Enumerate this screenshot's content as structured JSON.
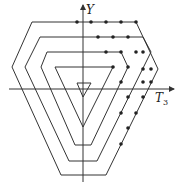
{
  "diagram": {
    "type": "weight-diagram",
    "axes": {
      "vertical_label": "Y",
      "horizontal_label": "T",
      "horizontal_subscript": "3"
    },
    "colors": {
      "line": "#333333",
      "dot": "#222222",
      "background": "#ffffff"
    },
    "shells": [
      {
        "name": "outer-hexagon",
        "points": [
          [
            32,
            22
          ],
          [
            136,
            22
          ],
          [
            158,
            69
          ],
          [
            106,
            175
          ],
          [
            61,
            175
          ],
          [
            12,
            67
          ]
        ]
      },
      {
        "name": "second-hexagon",
        "points": [
          [
            40,
            37
          ],
          [
            143,
            37
          ],
          [
            151,
            52
          ],
          [
            97,
            161
          ],
          [
            69,
            161
          ],
          [
            25,
            67
          ]
        ]
      },
      {
        "name": "third-hexagon",
        "points": [
          [
            47,
            52
          ],
          [
            121,
            52
          ],
          [
            128,
            67
          ],
          [
            91,
            145
          ],
          [
            75,
            145
          ],
          [
            41,
            67
          ]
        ]
      },
      {
        "name": "inner-triangle",
        "points": [
          [
            55,
            67
          ],
          [
            113,
            67
          ],
          [
            83,
            127
          ]
        ]
      },
      {
        "name": "center-triangle",
        "points": [
          [
            77,
            83
          ],
          [
            91,
            83
          ],
          [
            83,
            97
          ]
        ]
      }
    ],
    "dots": [
      [
        77,
        22
      ],
      [
        91,
        22
      ],
      [
        106,
        22
      ],
      [
        121,
        22
      ],
      [
        136,
        22
      ],
      [
        98,
        37
      ],
      [
        113,
        37
      ],
      [
        128,
        37
      ],
      [
        143,
        52
      ],
      [
        151,
        69
      ],
      [
        106,
        52
      ],
      [
        121,
        52
      ],
      [
        136,
        52
      ],
      [
        143,
        69
      ],
      [
        113,
        67
      ],
      [
        128,
        67
      ],
      [
        121,
        82
      ],
      [
        143,
        82
      ],
      [
        151,
        82
      ],
      [
        128,
        97
      ],
      [
        143,
        97
      ],
      [
        121,
        113
      ],
      [
        136,
        113
      ],
      [
        128,
        128
      ],
      [
        121,
        144
      ]
    ]
  }
}
